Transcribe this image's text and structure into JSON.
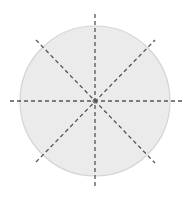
{
  "diagram": {
    "type": "circle-with-symmetry-lines",
    "canvas": {
      "width": 190,
      "height": 202
    },
    "circle": {
      "cx": 95,
      "cy": 101,
      "r": 75,
      "fill": "#ebebeb",
      "stroke": "#d4d4d4"
    },
    "center_point": {
      "x": 95,
      "y": 101
    },
    "line_style": {
      "color": "#555555",
      "dash": "4 3",
      "width": 1.3
    },
    "lines": [
      {
        "name": "vertical",
        "x1": 95,
        "y1": 14,
        "x2": 95,
        "y2": 189
      },
      {
        "name": "horizontal",
        "x1": 10,
        "y1": 101,
        "x2": 182,
        "y2": 101
      },
      {
        "name": "diagonal-down",
        "x1": 36,
        "y1": 40,
        "x2": 155,
        "y2": 163
      },
      {
        "name": "diagonal-up",
        "x1": 36,
        "y1": 162,
        "x2": 155,
        "y2": 40
      }
    ],
    "line_count": 4
  }
}
